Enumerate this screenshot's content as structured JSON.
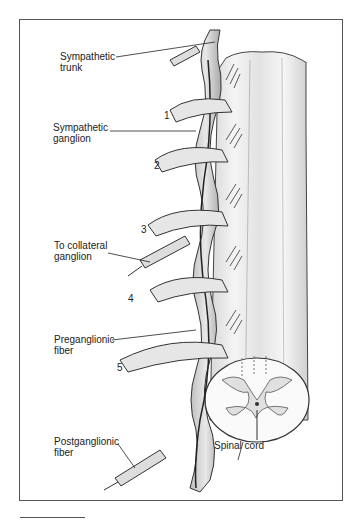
{
  "figure": {
    "type": "anatomical illustration",
    "labels": {
      "sympathetic_trunk": "Sympathetic\ntrunk",
      "sympathetic_ganglion": "Sympathetic\nganglion",
      "to_collateral_ganglion": "To collateral\nganglion",
      "preganglionic_fiber": "Preganglionic\nfiber",
      "postganglionic_fiber": "Postganglionic\nfiber",
      "spinal_cord": "Spinal cord"
    },
    "nerve_numbers": [
      "1",
      "2",
      "3",
      "4",
      "5"
    ]
  }
}
